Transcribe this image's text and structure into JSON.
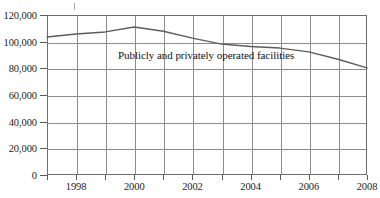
{
  "chart_data": {
    "type": "line",
    "title": "",
    "subtitle": "",
    "xlabel": "",
    "ylabel": "",
    "xlim": [
      1997,
      2008
    ],
    "ylim": [
      0,
      120000
    ],
    "grid": true,
    "legend_position": "inline-annotation",
    "annotations": [
      {
        "text": "Publicly and privately operated facilities",
        "x": 2001,
        "y": 88000
      }
    ],
    "x": [
      1997,
      1998,
      1999,
      2000,
      2001,
      2002,
      2003,
      2004,
      2005,
      2006,
      2007,
      2008
    ],
    "series": [
      {
        "name": "Publicly and privately operated facilities",
        "color": "#5d5d5d",
        "values": [
          103500,
          105700,
          107300,
          111000,
          107800,
          102700,
          98200,
          96400,
          95200,
          92300,
          86800,
          80300
        ]
      }
    ],
    "y_ticks": [
      0,
      20000,
      40000,
      60000,
      80000,
      100000,
      120000
    ],
    "y_tick_labels": [
      "0",
      "20,000",
      "40,000",
      "60,000",
      "80,000",
      "100,000",
      "120,000"
    ],
    "x_ticks": [
      1997,
      1998,
      1999,
      2000,
      2001,
      2002,
      2003,
      2004,
      2005,
      2006,
      2007,
      2008
    ],
    "x_tick_labels": [
      "",
      "1998",
      "",
      "2000",
      "",
      "2002",
      "",
      "2004",
      "",
      "2006",
      "",
      "2008"
    ]
  },
  "colors": {
    "series_line": "#5d5d5d",
    "grid": "#8d8d8d",
    "frame": "#6e6e6e",
    "text": "#1b1b1b",
    "background": "#ffffff"
  }
}
